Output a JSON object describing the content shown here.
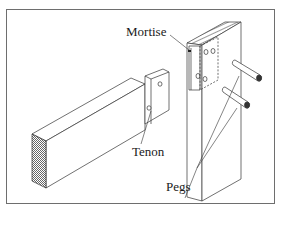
{
  "diagram": {
    "labels": {
      "mortise": "Mortise",
      "tenon": "Tenon",
      "pegs": "Pegs"
    },
    "components": [
      "mortise-member",
      "tenon-member",
      "peg-upper",
      "peg-lower"
    ],
    "colors": {
      "line": "#3a3a3a",
      "frame": "#6e6e6e",
      "background": "#ffffff"
    }
  }
}
